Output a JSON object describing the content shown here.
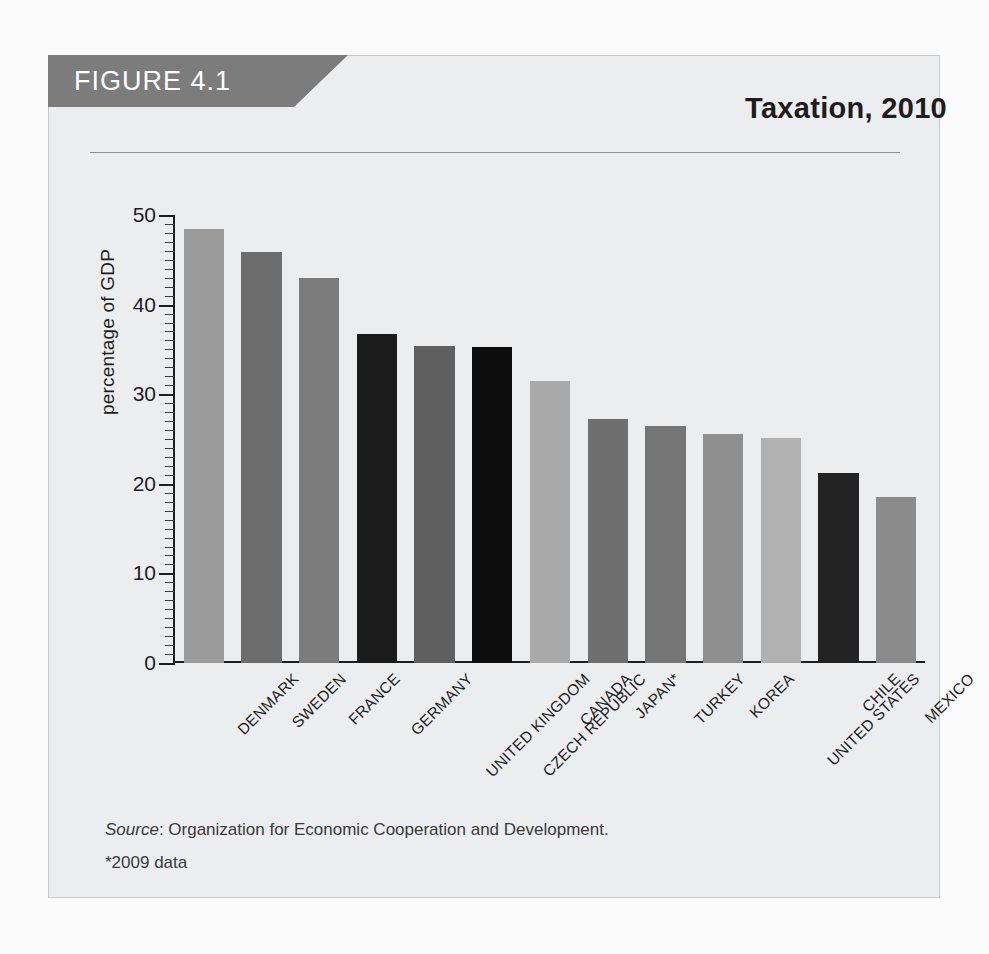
{
  "figure": {
    "banner_label": "FIGURE 4.1",
    "title": "Taxation, 2010",
    "source_prefix": "Source",
    "source_text": ": Organization for Economic Cooperation and Development.",
    "footnote": "*2009 data"
  },
  "chart_data": {
    "type": "bar",
    "title": "Taxation, 2010",
    "xlabel": "",
    "ylabel": "percentage of GDP",
    "ylim": [
      0,
      50
    ],
    "ytick_step": 10,
    "yminor_step": 1,
    "grid": false,
    "legend": "none",
    "categories": [
      "DENMARK",
      "SWEDEN",
      "FRANCE",
      "GERMANY",
      "UNITED KINGDOM",
      "CZECH REPUBLIC",
      "CANADA",
      "JAPAN*",
      "TURKEY",
      "KOREA",
      "UNITED STATES",
      "CHILE",
      "MEXICO"
    ],
    "values": [
      48.4,
      45.9,
      43.0,
      36.7,
      35.4,
      35.3,
      31.5,
      27.2,
      26.5,
      25.6,
      25.1,
      21.2,
      18.5
    ],
    "tick_labels": [
      "0",
      "10",
      "20",
      "30",
      "40",
      "50"
    ],
    "bar_colors": [
      "#9b9b9b",
      "#6d6d6d",
      "#7b7b7b",
      "#1b1b1b",
      "#5f5f5f",
      "#0d0d0d",
      "#a9a9a9",
      "#6e6e6e",
      "#757575",
      "#8f8f8f",
      "#b1b1b1",
      "#232323",
      "#8b8b8b"
    ],
    "source": "Organization for Economic Cooperation and Development.",
    "annotations": [
      "*2009 data"
    ]
  },
  "colors": {
    "banner": "#7c7c7c",
    "panel": "#ecedee",
    "axis": "#1d1d1d",
    "text": "#1d1d1d"
  }
}
